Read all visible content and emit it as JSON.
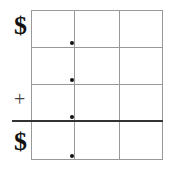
{
  "diagram": {
    "type": "place-value addition grid",
    "rows": 4,
    "columns": 3,
    "symbols": {
      "top_currency": "$",
      "operator": "+",
      "result_currency": "$"
    },
    "decimal_points": 4
  }
}
